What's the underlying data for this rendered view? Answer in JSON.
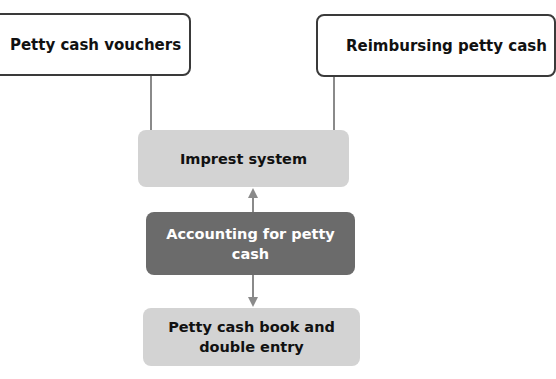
{
  "diagram": {
    "nodes": {
      "petty_cash_vouchers": "Petty cash vouchers",
      "reimbursing_petty_cash": "Reimbursing petty cash",
      "imprest_system": "Imprest system",
      "accounting_for_petty_cash": "Accounting for petty cash",
      "petty_cash_book": "Petty cash book and double entry"
    },
    "edges": [
      {
        "from": "petty_cash_vouchers",
        "to": "imprest_system",
        "type": "line"
      },
      {
        "from": "reimbursing_petty_cash",
        "to": "imprest_system",
        "type": "line"
      },
      {
        "from": "accounting_for_petty_cash",
        "to": "imprest_system",
        "type": "arrow"
      },
      {
        "from": "accounting_for_petty_cash",
        "to": "petty_cash_book",
        "type": "arrow"
      }
    ],
    "colors": {
      "outline_box_border": "#3a3a3a",
      "light_box_fill": "#d3d3d3",
      "dark_box_fill": "#6b6b6b",
      "connector": "#8a8a8a"
    }
  }
}
